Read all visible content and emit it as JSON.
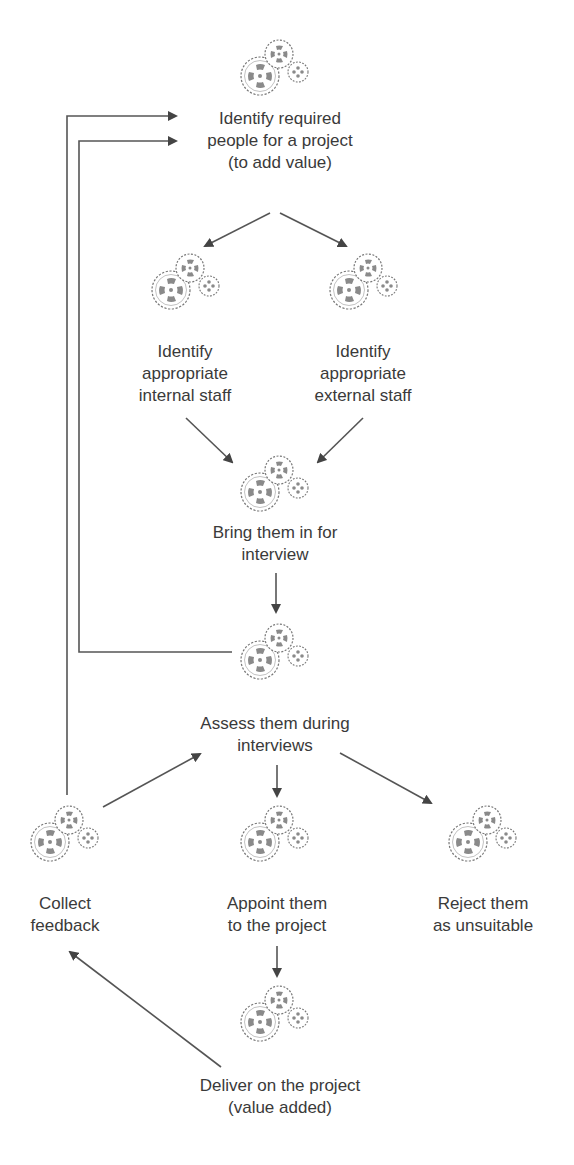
{
  "diagram": {
    "type": "flowchart",
    "colors": {
      "line": "#555555",
      "text": "#3a3a3a",
      "gear_outline": "#777777",
      "gear_fill": "#8a8a8a",
      "background": "#ffffff"
    },
    "icon": "gears-icon",
    "nodes": [
      {
        "id": "identify-people",
        "label": "Identify required\npeople for a project\n(to add value)"
      },
      {
        "id": "internal-staff",
        "label": "Identify\nappropriate\ninternal staff"
      },
      {
        "id": "external-staff",
        "label": "Identify\nappropriate\nexternal staff"
      },
      {
        "id": "bring-in",
        "label": "Bring them in for\ninterview"
      },
      {
        "id": "assess",
        "label": "Assess them during\ninterviews"
      },
      {
        "id": "collect-feedback",
        "label": "Collect\nfeedback"
      },
      {
        "id": "appoint",
        "label": "Appoint them\nto the project"
      },
      {
        "id": "reject",
        "label": "Reject them\nas unsuitable"
      },
      {
        "id": "deliver",
        "label": "Deliver on the project\n(value added)"
      }
    ],
    "edges": [
      {
        "from": "identify-people",
        "to": "internal-staff"
      },
      {
        "from": "identify-people",
        "to": "external-staff"
      },
      {
        "from": "internal-staff",
        "to": "bring-in"
      },
      {
        "from": "external-staff",
        "to": "bring-in"
      },
      {
        "from": "bring-in",
        "to": "assess"
      },
      {
        "from": "assess",
        "to": "identify-people",
        "note": "loop back (inner line)"
      },
      {
        "from": "assess",
        "to": "appoint"
      },
      {
        "from": "assess",
        "to": "reject"
      },
      {
        "from": "appoint",
        "to": "deliver"
      },
      {
        "from": "deliver",
        "to": "collect-feedback"
      },
      {
        "from": "collect-feedback",
        "to": "assess"
      },
      {
        "from": "collect-feedback",
        "to": "identify-people",
        "note": "loop back (outer line)"
      }
    ]
  }
}
